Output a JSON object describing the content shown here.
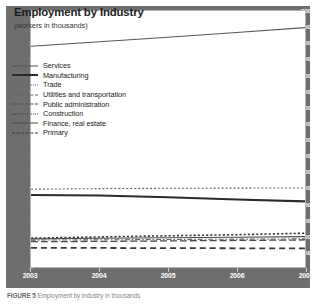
{
  "figure": {
    "title": "Employment by Industry",
    "subtitle": "(workers in thousands)",
    "caption_label": "FIGURE 5",
    "caption_text": "Employment by industry in thousands"
  },
  "chart_data": {
    "type": "line",
    "title": "Employment by Industry",
    "subtitle": "(workers in thousands)",
    "xlabel": "",
    "ylabel": "workers in thousands",
    "xlim": [
      2003,
      2007
    ],
    "ylim": [
      0,
      8000
    ],
    "ytick_step": 500,
    "grid": false,
    "legend_position": "upper-left-inside",
    "x": [
      2003,
      2004,
      2005,
      2006,
      2007
    ],
    "xtick_labels": [
      "2003",
      "2004",
      "2005",
      "2006",
      "2007"
    ],
    "ytick_labels": [
      "8000",
      "7500",
      "7000",
      "6500",
      "6000",
      "5500",
      "5000",
      "4500",
      "4000",
      "3500",
      "3000",
      "2500",
      "2000",
      "1500",
      "1000",
      "500",
      "0"
    ],
    "series": [
      {
        "name": "Services",
        "style": "solid-thin",
        "color": "#555555",
        "width": 1.1,
        "dash": "none",
        "values": [
          6900,
          7040,
          7180,
          7330,
          7480
        ]
      },
      {
        "name": "Manufacturing",
        "style": "solid-thick",
        "color": "#2b2b2b",
        "width": 2.1,
        "dash": "none",
        "values": [
          2250,
          2235,
          2180,
          2110,
          2050
        ]
      },
      {
        "name": "Trade",
        "style": "dotted-fine",
        "color": "#666666",
        "width": 1.1,
        "dash": "2,2",
        "values": [
          2430,
          2450,
          2460,
          2465,
          2470
        ]
      },
      {
        "name": "Utilities and transportation",
        "style": "dashdot",
        "color": "#666666",
        "width": 1.1,
        "dash": "5,2,1.5,2",
        "values": [
          840,
          850,
          860,
          870,
          880
        ]
      },
      {
        "name": "Public administration",
        "style": "dash-long",
        "color": "#4a4a4a",
        "width": 1.3,
        "dash": "7,3",
        "values": [
          790,
          800,
          815,
          830,
          845
        ]
      },
      {
        "name": "Construction",
        "style": "dotted",
        "color": "#3a3a3a",
        "width": 1.6,
        "dash": "2.2,2",
        "values": [
          900,
          940,
          975,
          1010,
          1055
        ]
      },
      {
        "name": "Finance, real estate",
        "style": "solid",
        "color": "#4a4a4a",
        "width": 1.1,
        "dash": "none",
        "values": [
          880,
          900,
          915,
          930,
          950
        ]
      },
      {
        "name": "Primary",
        "style": "dash",
        "color": "#3a3a3a",
        "width": 1.8,
        "dash": "6,4",
        "values": [
          600,
          595,
          590,
          585,
          580
        ]
      }
    ]
  },
  "colors": {
    "band": "#6e6e6e",
    "panel": "#ffffff",
    "panel_border": "#b5b5b5",
    "tick_text": "#ffffff",
    "title_text": "#1b1b1b"
  }
}
